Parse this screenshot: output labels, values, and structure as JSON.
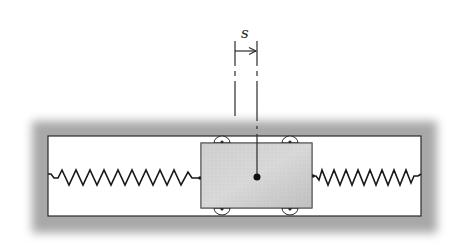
{
  "diagram": {
    "type": "mechanical-schematic",
    "labels": {
      "displacement": "s"
    },
    "components": {
      "frame": {
        "inner_left": 48,
        "inner_right": 421,
        "inner_top": 136,
        "inner_bottom": 216
      },
      "block": {
        "x": 201,
        "y": 143,
        "width": 111,
        "height": 65
      },
      "left_spring": {
        "from_x": 48,
        "to_x": 201,
        "y": 177,
        "coils": 10
      },
      "right_spring": {
        "from_x": 312,
        "to_x": 421,
        "y": 177,
        "coils": 9
      },
      "center_dot": {
        "cx": 257,
        "cy": 177
      },
      "dimension": {
        "left_x": 235,
        "right_x": 257,
        "arrow_y": 50
      }
    },
    "colors": {
      "line": "#1a1a1a",
      "block_fill": "#c8c8c8",
      "shadow": "#9a9a9a",
      "background": "#ffffff"
    }
  }
}
